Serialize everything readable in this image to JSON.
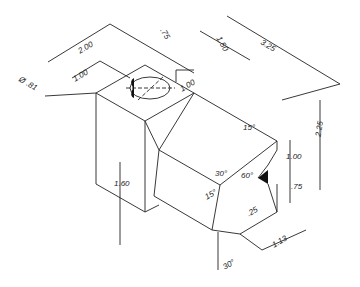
{
  "drawing": {
    "type": "isometric mechanical drawing",
    "dimensions": {
      "overall_length": "3.25",
      "block_width": "2.00",
      "hole_offset": "1.00",
      "hole_diameter": "Ø .81",
      "top_offset": ".75",
      "step_length": "1.50",
      "hole_depth_dim": "1.00",
      "overall_height": "2.25",
      "block_height": "1.60",
      "notch_height": "1.00",
      "notch_lower": ".75",
      "notch_depth": ".25",
      "base_length": "1.13"
    },
    "angles": {
      "a15_top": "15°",
      "a30_mid": "30°",
      "a60": "60°",
      "a15_side": "15°",
      "a30_bottom": "30°"
    }
  }
}
